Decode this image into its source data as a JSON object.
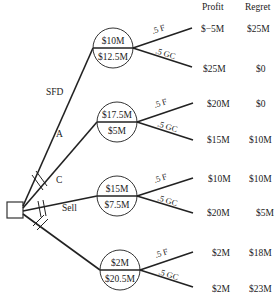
{
  "headers": {
    "profit": "Profit",
    "regret": "Regret"
  },
  "decision_node": {
    "shape": "square"
  },
  "branches": [
    {
      "label": "SFD",
      "pruned": false,
      "chance_node": {
        "expected_profit": "$10M",
        "expected_regret": "$12.5M"
      },
      "outcomes": [
        {
          "prob": ".5",
          "event": "F",
          "profit": "$−5M",
          "regret": "$25M"
        },
        {
          "prob": ".5",
          "event": "GC",
          "profit": "$25M",
          "regret": "$0"
        }
      ]
    },
    {
      "label": "A",
      "pruned": true,
      "chance_node": {
        "expected_profit": "$17.5M",
        "expected_regret": "$5M"
      },
      "outcomes": [
        {
          "prob": ".5",
          "event": "F",
          "profit": "$20M",
          "regret": "$0"
        },
        {
          "prob": ".5",
          "event": "GC",
          "profit": "$15M",
          "regret": "$10M"
        }
      ]
    },
    {
      "label": "C",
      "pruned": true,
      "chance_node": {
        "expected_profit": "$15M",
        "expected_regret": "$7.5M"
      },
      "outcomes": [
        {
          "prob": ".5",
          "event": "F",
          "profit": "$10M",
          "regret": "$10M"
        },
        {
          "prob": ".5",
          "event": "GC",
          "profit": "$20M",
          "regret": "$5M"
        }
      ]
    },
    {
      "label": "Sell",
      "pruned": true,
      "chance_node": {
        "expected_profit": "$2M",
        "expected_regret": "$20.5M"
      },
      "outcomes": [
        {
          "prob": ".5",
          "event": "F",
          "profit": "$2M",
          "regret": "$18M"
        },
        {
          "prob": ".5",
          "event": "GC",
          "profit": "$2M",
          "regret": "$23M"
        }
      ]
    }
  ]
}
